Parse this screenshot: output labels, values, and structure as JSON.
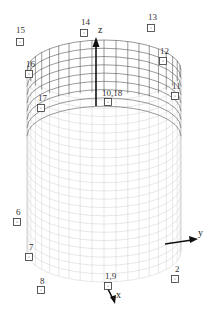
{
  "figure": {
    "type": "3d-cylinder-node-diagram",
    "axes": {
      "x": {
        "label": "x"
      },
      "y": {
        "label": "y"
      },
      "z": {
        "label": "z"
      }
    },
    "colors": {
      "grid_back": "#555555",
      "grid_front": "#d6d6d6",
      "node_stroke": "#333333",
      "axis": "#111111"
    },
    "nodes": [
      {
        "id": "15",
        "label": "15",
        "x": 20,
        "y": 42,
        "lx": 16,
        "ly": 33
      },
      {
        "id": "14",
        "label": "14",
        "x": 84,
        "y": 33,
        "lx": 81,
        "ly": 25
      },
      {
        "id": "13",
        "label": "13",
        "x": 151,
        "y": 28,
        "lx": 148,
        "ly": 20
      },
      {
        "id": "12",
        "label": "12",
        "x": 163,
        "y": 61,
        "lx": 160,
        "ly": 54
      },
      {
        "id": "16",
        "label": "16",
        "x": 29,
        "y": 74,
        "lx": 26,
        "ly": 67
      },
      {
        "id": "11",
        "label": "11",
        "x": 175,
        "y": 96,
        "lx": 172,
        "ly": 89
      },
      {
        "id": "17",
        "label": "17",
        "x": 41,
        "y": 108,
        "lx": 38,
        "ly": 101
      },
      {
        "id": "10,18",
        "label": "10,18",
        "x": 108,
        "y": 102,
        "lx": 102,
        "ly": 96
      },
      {
        "id": "6",
        "label": "6",
        "x": 17,
        "y": 222,
        "lx": 16,
        "ly": 215
      },
      {
        "id": "7",
        "label": "7",
        "x": 29,
        "y": 257,
        "lx": 29,
        "ly": 250
      },
      {
        "id": "8",
        "label": "8",
        "x": 41,
        "y": 290,
        "lx": 40,
        "ly": 284
      },
      {
        "id": "1,9",
        "label": "1,9",
        "x": 108,
        "y": 286,
        "lx": 105,
        "ly": 279
      },
      {
        "id": "2",
        "label": "2",
        "x": 175,
        "y": 279,
        "lx": 175,
        "ly": 272
      }
    ]
  }
}
